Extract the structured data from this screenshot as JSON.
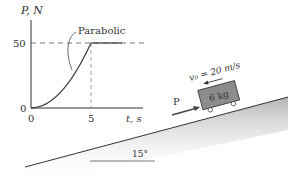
{
  "graph": {
    "y_axis_label": "P, N",
    "x_axis_label": "t, s",
    "y_ticks": [
      "50",
      "0"
    ],
    "x_ticks": [
      "0",
      "5"
    ],
    "curve_annotation": "Parabolic"
  },
  "block": {
    "mass_label": "6 kg",
    "velocity_label": "v₀ = 20 m/s",
    "force_label": "P"
  },
  "incline": {
    "angle_label": "15°"
  },
  "colors": {
    "line": "#333333",
    "block_fill": "#8c8c8c",
    "dashed": "#555555"
  }
}
